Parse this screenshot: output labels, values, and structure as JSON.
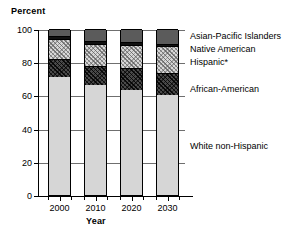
{
  "chart_data": {
    "type": "bar",
    "subtype": "stacked-100-percent",
    "title": "",
    "ylabel": "Percent",
    "xlabel": "Year",
    "categories": [
      "2000",
      "2010",
      "2020",
      "2030"
    ],
    "ylim": [
      0,
      100
    ],
    "yticks": [
      0,
      20,
      40,
      60,
      80,
      100
    ],
    "ytick_labels": [
      "0",
      "20",
      "40",
      "60",
      "80",
      "100"
    ],
    "grid": "horizontal",
    "legend_position": "right-inline",
    "series": [
      {
        "name": "White non-Hispanic",
        "pattern": "light-gray-solid",
        "color": "#d6d6d6",
        "values": [
          71,
          66,
          63,
          60
        ]
      },
      {
        "name": "African-American",
        "pattern": "dark-crosshatch",
        "color": "#4a4a4a",
        "values": [
          11,
          12,
          13.5,
          13.5
        ]
      },
      {
        "name": "Hispanic*",
        "pattern": "light-crosshatch",
        "color": "#d7d7d7",
        "values": [
          12,
          13,
          14,
          16
        ]
      },
      {
        "name": "Native American",
        "pattern": "black-solid",
        "color": "#111111",
        "values": [
          1.5,
          1.5,
          1.5,
          1.5
        ]
      },
      {
        "name": "Asian-Pacific Islanders",
        "pattern": "dark-gray-solid",
        "color": "#5b5b5b",
        "values": [
          4.5,
          7.5,
          8,
          9
        ]
      }
    ]
  },
  "axes": {
    "y_title": "Percent",
    "x_title": "Year"
  },
  "legend": {
    "asian_pacific": "Asian-Pacific Islanders",
    "native_american": "Native American",
    "hispanic": "Hispanic*",
    "african_american": "African-American",
    "white_non_hispanic": "White non-Hispanic"
  }
}
